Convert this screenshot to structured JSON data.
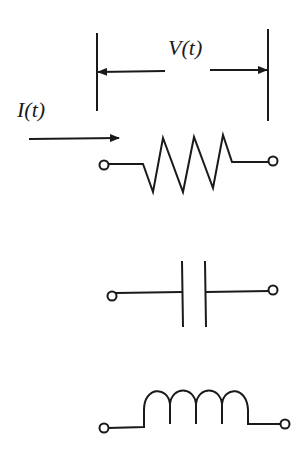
{
  "diagram": {
    "title": "",
    "labels": {
      "voltage": "V(t)",
      "current": "I(t)"
    },
    "components": [
      {
        "id": "resistor",
        "name": "Resistor",
        "symbol": "zigzag"
      },
      {
        "id": "capacitor",
        "name": "Capacitor",
        "symbol": "parallel-plates"
      },
      {
        "id": "inductor",
        "name": "Inductor",
        "symbol": "coil"
      }
    ],
    "colors": {
      "line": "#1a1a1a",
      "background": "#ffffff"
    }
  }
}
